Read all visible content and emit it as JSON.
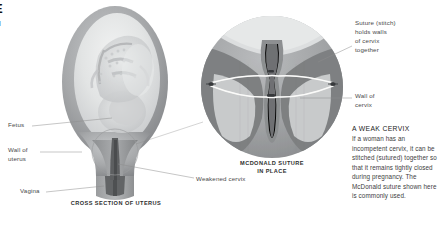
{
  "page": {
    "background": "#ffffff",
    "width": 443,
    "height": 226
  },
  "crop_title": {
    "line1": "E",
    "line2": "M"
  },
  "left_figure": {
    "caption": "CROSS SECTION OF UTERUS",
    "labels": [
      {
        "id": "fetus",
        "text": "Fetus"
      },
      {
        "id": "wall-of-uterus",
        "text": "Wall of\nuterus"
      },
      {
        "id": "vagina",
        "text": "Vagina"
      },
      {
        "id": "weakened-cervix",
        "text": "Weakened cervix"
      }
    ]
  },
  "center_figure": {
    "caption": "MCDONALD SUTURE\nIN PLACE",
    "labels": [
      {
        "id": "suture-stitch",
        "text": "Suture (stitch)\nholds walls\nof cervix\ntogether"
      },
      {
        "id": "wall-of-cervix",
        "text": "Wall of\ncervix"
      }
    ]
  },
  "side_note": {
    "heading": "A WEAK CERVIX",
    "body": "If a woman has an incompetent cervix, it can be stitched (sutured) together so that it remains tightly closed during pregnancy. The McDonald suture shown here is commonly used."
  },
  "colors": {
    "background": "#ffffff",
    "uterus_wall_dark": "#8f9193",
    "uterus_wall_mid": "#a9abad",
    "uterus_wall_light": "#c9cbcd",
    "amniotic_light": "#e8eaea",
    "fetus_light": "#d7d9da",
    "cervix_dark": "#6d6f71",
    "cervix_canal": "#5a5c5e",
    "circle_tissue_mid": "#a3a5a7",
    "circle_tissue_dark": "#7b7d7f",
    "circle_lumen_light": "#d9dbdb",
    "suture_thread": "#f4f4f2",
    "knot": "#3a3c3e",
    "leader_line": "#8c8c8c",
    "label_text": "#4a4a4a",
    "caption_text": "#2e2e2e",
    "body_text": "#3d3d3d",
    "heading_text": "#222222"
  }
}
